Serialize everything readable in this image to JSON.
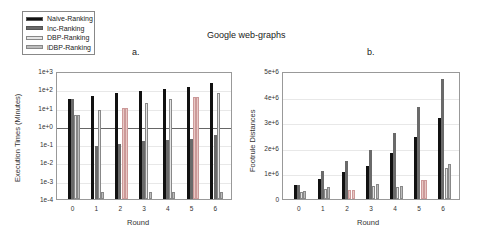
{
  "figure_title": "Google web-graphs",
  "legend": [
    {
      "label": "Naive-Ranking",
      "color": "#111111"
    },
    {
      "label": "Inc-Ranking",
      "color": "#6a6a6a"
    },
    {
      "label": "DBP-Ranking",
      "color": "#e4e4e4"
    },
    {
      "label": "iDBP-Ranking",
      "color": "#bcbcbc"
    }
  ],
  "chart_data": [
    {
      "type": "bar",
      "panel": "a.",
      "title": "",
      "xlabel": "Round",
      "ylabel": "Execution Times (Minutes)",
      "yscale": "log",
      "ylim": [
        0.0001,
        1000
      ],
      "yticks": [
        "1e-4",
        "1e-3",
        "1e-2",
        "1e-1",
        "1e+0",
        "1e+1",
        "1e+2",
        "1e+3"
      ],
      "categories": [
        "0",
        "1",
        "2",
        "3",
        "4",
        "5",
        "6"
      ],
      "series": [
        {
          "name": "Naive-Ranking",
          "values": [
            30,
            45,
            60,
            80,
            100,
            140,
            220
          ]
        },
        {
          "name": "Inc-Ranking",
          "values": [
            30,
            0.08,
            0.1,
            0.15,
            0.17,
            0.2,
            0.3
          ]
        },
        {
          "name": "DBP-Ranking",
          "values": [
            4,
            7,
            10,
            18,
            28,
            40,
            60
          ]
        },
        {
          "name": "iDBP-Ranking",
          "values": [
            4,
            0.00025,
            10,
            0.00025,
            0.00025,
            40,
            0.00025
          ]
        }
      ],
      "grid": true,
      "legend_position": "upper-left"
    },
    {
      "type": "bar",
      "panel": "b.",
      "title": "",
      "xlabel": "Round",
      "ylabel": "Footrule Distances",
      "ylim": [
        0,
        5000000
      ],
      "yticks": [
        "0",
        "1e+6",
        "2e+6",
        "3e+6",
        "4e+6",
        "5e+6"
      ],
      "categories": [
        "0",
        "1",
        "2",
        "3",
        "4",
        "5",
        "6"
      ],
      "series": [
        {
          "name": "Naive-Ranking",
          "values": [
            550000,
            780000,
            1050000,
            1300000,
            1780000,
            2420000,
            3150000
          ]
        },
        {
          "name": "Inc-Ranking",
          "values": [
            550000,
            1080000,
            1480000,
            1900000,
            2580000,
            3580000,
            4700000
          ]
        },
        {
          "name": "DBP-Ranking",
          "values": [
            280000,
            400000,
            350000,
            520000,
            450000,
            750000,
            1200000
          ]
        },
        {
          "name": "iDBP-Ranking",
          "values": [
            320000,
            450000,
            350000,
            600000,
            500000,
            750000,
            1350000
          ]
        }
      ],
      "grid": true
    }
  ]
}
